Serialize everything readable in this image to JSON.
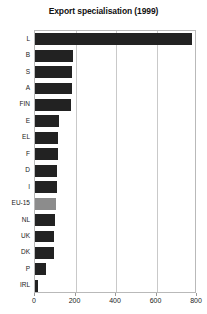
{
  "chart_data": {
    "type": "bar",
    "orientation": "horizontal",
    "title": "Export specialisation (1999)",
    "xlabel": "",
    "ylabel": "",
    "categories": [
      "L",
      "B",
      "S",
      "A",
      "FIN",
      "E",
      "EL",
      "F",
      "D",
      "I",
      "EU-15",
      "NL",
      "UK",
      "DK",
      "P",
      "IRL"
    ],
    "values": [
      776,
      186,
      183,
      182,
      180,
      120,
      115,
      112,
      110,
      108,
      105,
      100,
      96,
      92,
      55,
      15
    ],
    "xlim": [
      0,
      800
    ],
    "xticks": [
      0,
      200,
      400,
      600,
      800
    ],
    "xtick_labels": [
      "0",
      "200",
      "400",
      "600",
      "800"
    ],
    "grid": true,
    "grid_axis": "x",
    "legend": false,
    "bar_color": "#222222",
    "highlight_category": "EU-15",
    "highlight_color": "#8c8c8c",
    "gridline_color": "#c9c9c9",
    "frame_color": "#b9b9b9",
    "background_color": "#ffffff"
  }
}
